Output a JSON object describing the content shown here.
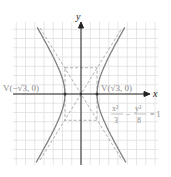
{
  "figure": {
    "type": "hyperbola-graph",
    "axis_labels": {
      "x": "x",
      "y": "y"
    },
    "vertex_left": "V(−√3, 0)",
    "vertex_right": "V(√3, 0)",
    "equation": {
      "term1_num": "x²",
      "term1_den": "3",
      "minus": "−",
      "term2_num": "y²",
      "term2_den": "8",
      "rhs": "= 1"
    },
    "colors": {
      "curve": "#888888",
      "grid": "#dddddd",
      "axis": "#222222",
      "dashed": "#999999"
    }
  }
}
